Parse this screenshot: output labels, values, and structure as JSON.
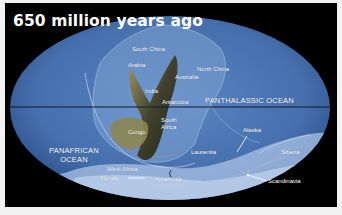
{
  "map": {
    "title": "650 million years ago",
    "projection": "mollweide-ellipse",
    "colors": {
      "background": "#000000",
      "ocean": "#4b76b3",
      "ocean_edge": "#2d4f86",
      "shelf": "#a9c3e6",
      "land": "#4c4a2c",
      "land_highlight": "#9a945c",
      "equator": "#0f1a33",
      "label": "#ffffff"
    },
    "oceans": [
      {
        "name": "PANTHALASSIC OCEAN"
      },
      {
        "name": "PANAFRICAN OCEAN",
        "line1": "PANAFRICAN",
        "line2": "OCEAN"
      }
    ],
    "landmasses": [
      "South China",
      "Arabia",
      "North China",
      "Australia",
      "India",
      "Antarctica",
      "South Africa",
      "Congo",
      "Alaska",
      "Laurentia",
      "Siberia",
      "West Africa",
      "Florida",
      "Amazonia",
      "Scandinavia"
    ],
    "copyright": "© 2009 C. R. Scotese, PALEOMAP Project"
  }
}
